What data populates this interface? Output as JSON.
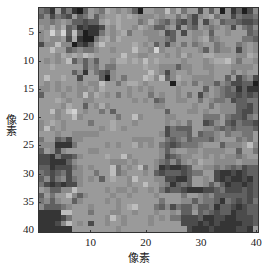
{
  "chart_data": {
    "type": "heatmap",
    "title": "",
    "xlabel": "像素",
    "ylabel": "像素",
    "xlim": [
      1,
      40
    ],
    "ylim": [
      1,
      40
    ],
    "x_ticks": [
      10,
      20,
      30,
      40
    ],
    "y_ticks": [
      5,
      10,
      15,
      20,
      25,
      30,
      35,
      40
    ],
    "colormap": "gray",
    "grid_size": [
      40,
      40
    ],
    "levels_palette": [
      "#1e1e1e",
      "#353535",
      "#4b4b4b",
      "#606060",
      "#757575",
      "#8a8a8a",
      "#9a9a9a",
      "#aaaaaa",
      "#bdbdbd",
      "#d2d2d2"
    ],
    "matrix_rows": [
      "4316241036547656530665585746626360513025",
      "3524326346356676765556566464256745524334",
      "5545653323367676664575435324262563443223",
      "6575734121126576657653356264365456526435",
      "5696938301146567466555623626556366566634",
      "5655627100467576666655543666567456666443",
      "2558550213686666676563525646456645664565",
      "6686634544566566686659566566653645562565",
      "6665767687666668665566656575667766665576",
      "6565683535366577676867666656665677864665",
      "6676666635464466666766555355665566655556",
      "6666663516432566666686525665666566646566",
      "6866766266630564666875835766555566362452",
      "6565666565586646776566660656465535422330",
      "5565656556576666565656666566663654341311",
      "3666566585765646566646566564625654332323",
      "6667656655666666656563466556646544523344",
      "6666576636575666666665566666566465553324",
      "6685689656646366666666636665565665553224",
      "6665668566666646685666655666664446433245",
      "5676566664666766656666656564662356324332",
      "5856566666656765666666624333665543434443",
      "6665665555566666666666524443634456455446",
      "4663425566666666655556643453444356664546",
      "5551114666665656675656432344456663555685",
      "3652566665566666666666535665565555663664",
      "2214223566667668566666523455665656554566",
      "2211135666666555656665435356576655556555",
      "3312224565666846568465121123665545434233",
      "4323425566466845666563233323446621121233",
      "3524524565636766586665522113665621211213",
      "4212122566666666566866541343665353122123",
      "6533558666665655656656423321112234222323",
      "3646685356666566566665666646654533333323",
      "4535663566665656666666466655354431432324",
      "5333456665666656786664352433533413321233",
      "1111886664666556656665665633634323312233",
      "1111246666665865666656564422231122112223",
      "1112586562665665666656666622212121111223",
      "1111116666666656666666666662111211112216"
    ]
  },
  "axes": {
    "xlabel": "像素",
    "ylabel": "像素",
    "x_tick_labels": [
      "10",
      "20",
      "30",
      "40"
    ],
    "y_tick_labels": [
      "5",
      "10",
      "15",
      "20",
      "25",
      "30",
      "35",
      "40"
    ]
  }
}
